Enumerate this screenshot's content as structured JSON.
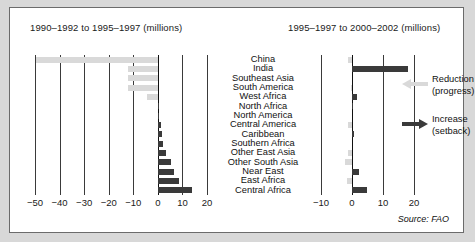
{
  "chart_data": {
    "type": "bar",
    "title": "",
    "orientation": "horizontal",
    "source": "Source: FAO",
    "categories": [
      "China",
      "India",
      "Southeast Asia",
      "South America",
      "West Africa",
      "North Africa",
      "North America",
      "Central America",
      "Caribbean",
      "Southern Africa",
      "Other East Asia",
      "Other South Asia",
      "Near East",
      "East Africa",
      "Central Africa"
    ],
    "legend": {
      "position": "right",
      "entries": [
        {
          "label": "Reduction\n(progress)",
          "label_line1": "Reduction",
          "label_line2": "(progress)",
          "color": "#d9d9d9",
          "symbol": "left-arrow"
        },
        {
          "label": "Increase\n(setback)",
          "label_line1": "Increase",
          "label_line2": "(setback)",
          "color": "#3a3a3a",
          "symbol": "right-arrow"
        }
      ]
    },
    "panels": [
      {
        "id": "left",
        "title": "1990–1992 to 1995–1997 (millions)",
        "xlabel": "",
        "ylabel": "",
        "xlim": [
          -50,
          20
        ],
        "ticks": [
          -50,
          -40,
          -30,
          -20,
          -10,
          0,
          10,
          20
        ],
        "tick_labels": [
          "−50",
          "−40",
          "−30",
          "−20",
          "−10",
          "0",
          "10",
          "20"
        ],
        "grid": true,
        "values": [
          -49.5,
          -12.0,
          -12.0,
          -12.0,
          -4.5,
          -0.6,
          -0.3,
          -1.2,
          -1.5,
          -2.3,
          -3.2,
          -5.2,
          -6.6,
          -8.6,
          -14.0
        ],
        "signed_values": [
          -49.5,
          -12.0,
          -12.0,
          -12.0,
          -4.5,
          0.6,
          0.3,
          1.2,
          1.5,
          2.3,
          3.2,
          5.2,
          6.6,
          8.6,
          14.0
        ],
        "plot_values": [
          -49.5,
          -12.0,
          -12.0,
          -12.0,
          -4.5,
          0.6,
          0.3,
          1.2,
          1.5,
          2.3,
          3.2,
          5.2,
          6.6,
          8.6,
          14.0
        ]
      },
      {
        "id": "right",
        "title": "1995–1997 to 2000–2002 (millions)",
        "xlabel": "",
        "ylabel": "",
        "xlim": [
          -10,
          20
        ],
        "ticks": [
          -10,
          0,
          10,
          20
        ],
        "tick_labels": [
          "−10",
          "0",
          "10",
          "20"
        ],
        "grid": true,
        "plot_values": [
          -1.3,
          18.0,
          0.0,
          -0.4,
          1.6,
          0.3,
          0.0,
          -1.2,
          0.5,
          0.0,
          -1.3,
          -2.2,
          2.3,
          -1.5,
          4.8
        ]
      }
    ],
    "colors": {
      "reduction": "#d9d9d9",
      "increase": "#3a3a3a",
      "gridline": "#3a3a3a",
      "zeroline": "#111111",
      "background": "#ffffff",
      "page_background": "#d8d8d8",
      "border": "#6b6b6b",
      "text": "#111111"
    }
  }
}
